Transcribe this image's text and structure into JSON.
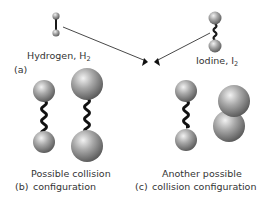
{
  "panel_a": {
    "tag": "(a)",
    "hydrogen": {
      "name": "Hydrogen, H",
      "subscript": "2"
    },
    "iodine": {
      "name": "Iodine, I",
      "subscript": "2"
    }
  },
  "panel_b": {
    "tag": "(b)",
    "line1": "Possible collision",
    "line2": "configuration"
  },
  "panel_c": {
    "tag": "(c)",
    "line1": "Another possible",
    "line2": "collision configuration"
  },
  "colors": {
    "sphere_light": "#e6e6e6",
    "sphere_dark": "#6e6e6e",
    "bond": "#1a1a1a",
    "arrow": "#333333"
  }
}
